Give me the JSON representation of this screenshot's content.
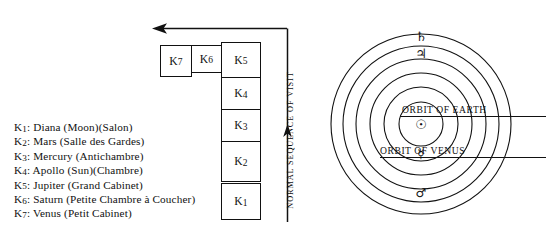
{
  "legend": {
    "items": [
      {
        "key": "K",
        "index": "1",
        "text": ": Diana (Moon)(Salon)"
      },
      {
        "key": "K",
        "index": "2",
        "text": ": Mars (Salle des Gardes)"
      },
      {
        "key": "K",
        "index": "3",
        "text": ": Mercury (Antichambre)"
      },
      {
        "key": "K",
        "index": "4",
        "text": ": Apollo (Sun)(Chambre)"
      },
      {
        "key": "K",
        "index": "5",
        "text": ": Jupiter (Grand Cabinet)"
      },
      {
        "key": "K",
        "index": "6",
        "text": ": Saturn (Petite Chambre à Coucher)"
      },
      {
        "key": "K",
        "index": "7",
        "text": ": Venus (Petit Cabinet)"
      }
    ]
  },
  "plan": {
    "rooms": [
      {
        "id": "K7",
        "key": "K",
        "index": "7"
      },
      {
        "id": "K6",
        "key": "K",
        "index": "6"
      },
      {
        "id": "K5",
        "key": "K",
        "index": "5"
      },
      {
        "id": "K4",
        "key": "K",
        "index": "4"
      },
      {
        "id": "K3",
        "key": "K",
        "index": "3"
      },
      {
        "id": "K2",
        "key": "K",
        "index": "2"
      },
      {
        "id": "K1",
        "key": "K",
        "index": "1"
      }
    ],
    "sequence_label": "NORMAL SEQUENCE OF VISIT"
  },
  "orbits": {
    "labels": {
      "earth": "ORBIT OF EARTH",
      "venus": "ORBIT OF VENUS"
    },
    "glyphs": {
      "saturn": "♄",
      "jupiter": "♃",
      "sun": "☉",
      "mercury": "☿",
      "mars": "♂"
    },
    "circle_count": 6
  },
  "colors": {
    "ink": "#111111",
    "paper": "#ffffff"
  }
}
